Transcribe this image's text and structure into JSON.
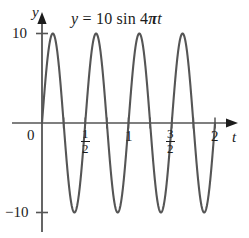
{
  "figure": {
    "background_color": "#ffffff",
    "curve_color": "#555555",
    "axis_color": "#3a3a3a",
    "text_color": "#1c1c1c",
    "width": 249,
    "height": 238
  },
  "title": {
    "full": "y = 10 sin 4πt",
    "lhs": "y",
    "equals": "=",
    "amplitude": "10",
    "function": "sin",
    "coefficient": "4",
    "pi": "π",
    "variable": "t"
  },
  "axes": {
    "y_axis_label": "y",
    "x_axis_label": "t",
    "y_ticks": [
      {
        "label": "10",
        "value": 10
      },
      {
        "label": "−10",
        "value": -10
      }
    ],
    "x_ticks": [
      {
        "label": "0",
        "value": 0,
        "is_fraction": false
      },
      {
        "label": "1/2",
        "value": 0.5,
        "is_fraction": true,
        "numerator": "1",
        "denominator": "2"
      },
      {
        "label": "1",
        "value": 1,
        "is_fraction": false
      },
      {
        "label": "3/2",
        "value": 1.5,
        "is_fraction": true,
        "numerator": "3",
        "denominator": "2"
      },
      {
        "label": "2",
        "value": 2,
        "is_fraction": false
      }
    ],
    "x_minor_tick_values": [
      0.25,
      0.5,
      0.75,
      1,
      1.25,
      1.5,
      1.75,
      2
    ],
    "origin_label": "0"
  },
  "chart_data": {
    "type": "line",
    "title": "y = 10 sin 4πt",
    "xlabel": "t",
    "ylabel": "y",
    "xlim": [
      0,
      2.05
    ],
    "ylim": [
      -12,
      12
    ],
    "grid": false,
    "legend": "none",
    "equation": "y = 10 sin(4*pi*t)",
    "amplitude": 10,
    "angular_frequency_coefficient": 4,
    "period": 0.5,
    "cycles_shown": 4,
    "series": [
      {
        "name": "y = 10 sin 4πt",
        "color": "#555555",
        "x": [
          0,
          0.05,
          0.1,
          0.125,
          0.15,
          0.2,
          0.25,
          0.3,
          0.35,
          0.375,
          0.4,
          0.45,
          0.5,
          0.55,
          0.6,
          0.625,
          0.65,
          0.7,
          0.75,
          0.8,
          0.85,
          0.875,
          0.9,
          0.95,
          1.0,
          1.05,
          1.1,
          1.125,
          1.15,
          1.2,
          1.25,
          1.3,
          1.35,
          1.375,
          1.4,
          1.45,
          1.5,
          1.55,
          1.6,
          1.625,
          1.65,
          1.7,
          1.75,
          1.8,
          1.85,
          1.875,
          1.9,
          1.95,
          2.0
        ],
        "y": [
          0,
          5.88,
          9.51,
          10,
          9.51,
          5.88,
          0,
          -5.88,
          -9.51,
          -10,
          -9.51,
          -5.88,
          0,
          5.88,
          9.51,
          10,
          9.51,
          5.88,
          0,
          -5.88,
          -9.51,
          -10,
          -9.51,
          -5.88,
          0,
          5.88,
          9.51,
          10,
          9.51,
          5.88,
          0,
          -5.88,
          -9.51,
          -10,
          -9.51,
          -5.88,
          0,
          5.88,
          9.51,
          10,
          9.51,
          5.88,
          0,
          -5.88,
          -9.51,
          -10,
          -9.51,
          -5.88,
          0
        ]
      }
    ],
    "maxima": [
      {
        "t": 0.125,
        "y": 10
      },
      {
        "t": 0.625,
        "y": 10
      },
      {
        "t": 1.125,
        "y": 10
      },
      {
        "t": 1.625,
        "y": 10
      }
    ],
    "minima": [
      {
        "t": 0.375,
        "y": -10
      },
      {
        "t": 0.875,
        "y": -10
      },
      {
        "t": 1.375,
        "y": -10
      },
      {
        "t": 1.875,
        "y": -10
      }
    ],
    "zeros": [
      0,
      0.25,
      0.5,
      0.75,
      1.0,
      1.25,
      1.5,
      1.75,
      2.0
    ]
  }
}
